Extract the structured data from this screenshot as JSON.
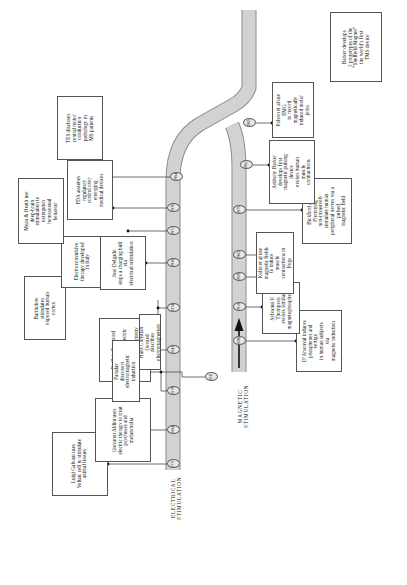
{
  "diagram": {
    "tracks": [
      {
        "id": "electrical",
        "label": "ELECTRICAL\nSTIMULATION"
      },
      {
        "id": "magnetic",
        "label": "MAGNETIC\nSTIMULATION"
      }
    ]
  },
  "years": {
    "y1771": "1771",
    "y1804": "1804",
    "y1843": "1843",
    "y1874": "1874",
    "y1938": "1938",
    "y1965": "1972",
    "y1976": "1976",
    "y1984": "1984",
    "y1819": "1819",
    "y1831": "1831",
    "y1896": "1896",
    "y1910": "1910",
    "y1959": "1959",
    "y1965b": "1965",
    "y1975": "1975",
    "y1982": "1982",
    "y1985": "1985"
  },
  "events": {
    "galvani": "Luigi Galvani uses\nVoltaic cell to stimulate\nanimal tissues",
    "aldini": "Giovanni Aldini uses\nelectric therapy to treat\npsychoses and melancholia",
    "dubois": "Du Bois Reymond shows\nlink between electric current\nand nerve cell activity",
    "bartholow": "Bartholow stimulates\nexposed human cortex",
    "ect": "Electroconvulsive\ntherapy developed\nin Italy",
    "delgado": "Jose Delgado\nstops a charging bull via\nelectrical stimulation",
    "moan": "Moan & Heath use\ndeep-brain stimulation to\nextinguish homosexual\nbehavior",
    "fda": "FDA assumes regulatory\ncontrol over emerging\nmedical devices",
    "tes": "TES discloses central motor\nconduction pathology in\nMS patients",
    "barker5": "Barker develops\n5 prototypes of the\n“Sheffield Magnet”\nthe world’s first\nTMS device",
    "polson": "Polson et al use EMG\nto record magnetically\ninduced motor jerks",
    "barker1": "Anthony Barker develops first\nmagnetic pulsing device\nevokes human muscle\ncontractions",
    "bickford": "Bickford and Fremming\nnon-invasively stimulate human\nperipheral nerves via a pulsed\nmagnetic field",
    "kolin": "Kolin et al use\nmagnetic fields to induce\nmuscle contractions in frogs",
    "thompson": "Sylvanus P. Thompson\nevokes similar\nmagnetophosphenes",
    "darsonval": "D’Arsonval induces\nphosphenes and vertigo\nin human subjects via\nmagnetic induction",
    "oersted": "Hans Christian Oersted\ndescribes electromagnetism",
    "faraday": "Faraday discovers\nelectromagnetic induction"
  },
  "colors": {
    "track_fill": "#d2d2d2",
    "track_stroke": "#8d8d8d",
    "box_stroke": "#555555",
    "connector": "#4a4a4a",
    "text": "#111111",
    "page_bg": "#ffffff"
  }
}
